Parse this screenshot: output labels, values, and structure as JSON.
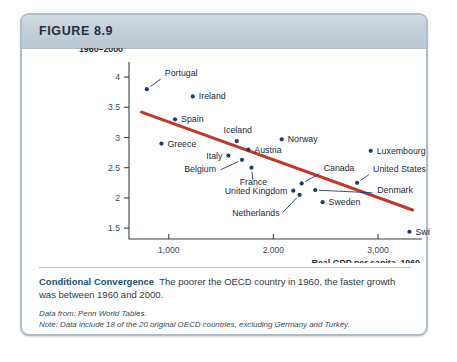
{
  "figure": {
    "number_label": "FIGURE 8.9",
    "caption_title": "Conditional Convergence",
    "caption_body": "The poorer the OECD country in 1960, the faster growth was between 1960 and 2000.",
    "source_note": "Data from: Penn World Tables.",
    "data_note": "Note: Data include 18 of the 20 original OECD countries, excluding Germany and Turkey."
  },
  "colors": {
    "frame_border": "#aebdc9",
    "header_fill": "#c3ced7",
    "point_navy": "#23386b",
    "trend_red": "#c0392b",
    "axis": "#33414d",
    "caption_accent": "#1d4f73"
  },
  "chart_data": {
    "type": "scatter",
    "title": "",
    "xlabel": "Real GDP per capita, 1960",
    "ylabel_line1": "Growth rate (%),",
    "ylabel_line2": "1960–2000",
    "xlim": [
      620,
      3420
    ],
    "ylim": [
      1.32,
      4.15
    ],
    "xticks": [
      1000,
      2000,
      3000
    ],
    "xtick_labels": [
      "1,000",
      "2,000",
      "3,000"
    ],
    "yticks": [
      1.5,
      2,
      2.5,
      3,
      3.5,
      4
    ],
    "ytick_labels": [
      "1.5",
      "2",
      "2.5",
      "3",
      "3.5",
      "4"
    ],
    "grid": false,
    "legend": "none",
    "points": [
      {
        "label": "Portugal",
        "x": 790,
        "y": 3.8,
        "label_dx": 18,
        "label_dy": -13,
        "anchor": "start",
        "leader": true
      },
      {
        "label": "Ireland",
        "x": 1230,
        "y": 3.68,
        "label_dx": 6,
        "label_dy": 3,
        "anchor": "start",
        "leader": false
      },
      {
        "label": "Spain",
        "x": 1060,
        "y": 3.3,
        "label_dx": 6,
        "label_dy": 3,
        "anchor": "start",
        "leader": false
      },
      {
        "label": "Iceland",
        "x": 1650,
        "y": 2.94,
        "label_dx": 1,
        "label_dy": -8,
        "anchor": "middle",
        "leader": false
      },
      {
        "label": "Greece",
        "x": 930,
        "y": 2.9,
        "label_dx": 6,
        "label_dy": 3,
        "anchor": "start",
        "leader": false
      },
      {
        "label": "Norway",
        "x": 2080,
        "y": 2.97,
        "label_dx": 6,
        "label_dy": 3,
        "anchor": "start",
        "leader": false
      },
      {
        "label": "Austria",
        "x": 1760,
        "y": 2.8,
        "label_dx": 6,
        "label_dy": 3,
        "anchor": "start",
        "leader": false
      },
      {
        "label": "Italy",
        "x": 1570,
        "y": 2.7,
        "label_dx": -6,
        "label_dy": 3,
        "anchor": "end",
        "leader": false
      },
      {
        "label": "Belgium",
        "x": 1700,
        "y": 2.63,
        "label_dx": -26,
        "label_dy": 12,
        "anchor": "end",
        "leader": true
      },
      {
        "label": "France",
        "x": 1790,
        "y": 2.5,
        "label_dx": 2,
        "label_dy": 17,
        "anchor": "middle",
        "leader": true
      },
      {
        "label": "Canada",
        "x": 2270,
        "y": 2.24,
        "label_dx": 22,
        "label_dy": -12,
        "anchor": "start",
        "leader": true
      },
      {
        "label": "United States",
        "x": 2800,
        "y": 2.25,
        "label_dx": 16,
        "label_dy": -11,
        "anchor": "start",
        "leader": true
      },
      {
        "label": "Luxembourg",
        "x": 2930,
        "y": 2.78,
        "label_dx": 6,
        "label_dy": 3,
        "anchor": "start",
        "leader": false
      },
      {
        "label": "United Kingdom",
        "x": 2190,
        "y": 2.12,
        "label_dx": -6,
        "label_dy": 3,
        "anchor": "end",
        "leader": false
      },
      {
        "label": "Denmark",
        "x": 2400,
        "y": 2.13,
        "label_dx": 62,
        "label_dy": 3,
        "anchor": "start",
        "leader": true
      },
      {
        "label": "Netherlands",
        "x": 2250,
        "y": 2.05,
        "label_dx": -20,
        "label_dy": 21,
        "anchor": "end",
        "leader": true
      },
      {
        "label": "Sweden",
        "x": 2470,
        "y": 1.93,
        "label_dx": 6,
        "label_dy": 3,
        "anchor": "start",
        "leader": false
      },
      {
        "label": "Switzerland",
        "x": 3300,
        "y": 1.44,
        "label_dx": 6,
        "label_dy": 3,
        "anchor": "start",
        "leader": false
      }
    ],
    "trend_line": {
      "label": "fitted-regression-line",
      "x_start": 740,
      "y_start": 3.42,
      "x_end": 3330,
      "y_end": 1.8
    }
  }
}
